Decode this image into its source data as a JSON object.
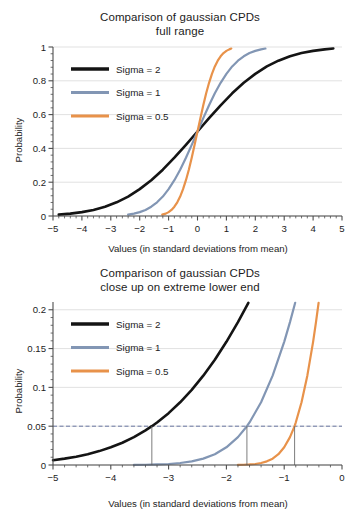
{
  "figure": {
    "width": 360,
    "height": 513,
    "background": "#ffffff"
  },
  "series_colors": {
    "sigma2": "#141414",
    "sigma1": "#8296b4",
    "sigma05": "#e8924a",
    "grid": "#d9d9d9",
    "axis": "#4d4d4d",
    "threshold_line": "#5a6a9a",
    "marker": "#6e6e6e"
  },
  "chart_data": [
    {
      "id": "full-range",
      "type": "line",
      "title": "Comparison of gaussian CPDs",
      "subtitle": "full range",
      "xlabel": "Values (in standard deviations from mean)",
      "ylabel": "Probability",
      "xlim": [
        -5,
        5
      ],
      "ylim": [
        0,
        1
      ],
      "xticks": [
        -5,
        -4,
        -3,
        -2,
        -1,
        0,
        1,
        2,
        3,
        4,
        5
      ],
      "xtick_labels": [
        "−5",
        "−4",
        "−3",
        "−2",
        "−1",
        "0",
        "1",
        "2",
        "3",
        "4",
        "5"
      ],
      "yticks": [
        0,
        0.2,
        0.4,
        0.6,
        0.8,
        1
      ],
      "ytick_labels": [
        "0",
        "0.2",
        "0.4",
        "0.6",
        "0.8",
        "1"
      ],
      "minor_xticks_per_interval": 5,
      "minor_yticks_per_interval": 5,
      "grid": "horizontal",
      "legend_position": "upper-left",
      "series": [
        {
          "name": "Sigma = 2",
          "sigma": 2,
          "color": "#141414",
          "x_range": [
            -4.8,
            4.7
          ],
          "points": [
            [
              -4.8,
              0.008
            ],
            [
              -4.4,
              0.014
            ],
            [
              -4.0,
              0.023
            ],
            [
              -3.6,
              0.036
            ],
            [
              -3.2,
              0.055
            ],
            [
              -2.8,
              0.081
            ],
            [
              -2.4,
              0.115
            ],
            [
              -2.0,
              0.159
            ],
            [
              -1.6,
              0.212
            ],
            [
              -1.2,
              0.274
            ],
            [
              -0.8,
              0.345
            ],
            [
              -0.4,
              0.421
            ],
            [
              0.0,
              0.5
            ],
            [
              0.4,
              0.579
            ],
            [
              0.8,
              0.655
            ],
            [
              1.2,
              0.726
            ],
            [
              1.6,
              0.788
            ],
            [
              2.0,
              0.841
            ],
            [
              2.4,
              0.885
            ],
            [
              2.8,
              0.919
            ],
            [
              3.2,
              0.945
            ],
            [
              3.6,
              0.964
            ],
            [
              4.0,
              0.977
            ],
            [
              4.4,
              0.986
            ],
            [
              4.7,
              0.991
            ]
          ]
        },
        {
          "name": "Sigma = 1",
          "sigma": 1,
          "color": "#8296b4",
          "x_range": [
            -2.4,
            2.35
          ],
          "points": [
            [
              -2.4,
              0.008
            ],
            [
              -2.2,
              0.014
            ],
            [
              -2.0,
              0.023
            ],
            [
              -1.8,
              0.036
            ],
            [
              -1.6,
              0.055
            ],
            [
              -1.4,
              0.081
            ],
            [
              -1.2,
              0.115
            ],
            [
              -1.0,
              0.159
            ],
            [
              -0.8,
              0.212
            ],
            [
              -0.6,
              0.274
            ],
            [
              -0.4,
              0.345
            ],
            [
              -0.2,
              0.421
            ],
            [
              0.0,
              0.5
            ],
            [
              0.2,
              0.579
            ],
            [
              0.4,
              0.655
            ],
            [
              0.6,
              0.726
            ],
            [
              0.8,
              0.788
            ],
            [
              1.0,
              0.841
            ],
            [
              1.2,
              0.885
            ],
            [
              1.4,
              0.919
            ],
            [
              1.6,
              0.945
            ],
            [
              1.8,
              0.964
            ],
            [
              2.0,
              0.977
            ],
            [
              2.2,
              0.986
            ],
            [
              2.35,
              0.991
            ]
          ]
        },
        {
          "name": "Sigma = 0.5",
          "sigma": 0.5,
          "color": "#e8924a",
          "x_range": [
            -1.22,
            1.17
          ],
          "points": [
            [
              -1.22,
              0.008
            ],
            [
              -1.1,
              0.014
            ],
            [
              -1.0,
              0.023
            ],
            [
              -0.9,
              0.036
            ],
            [
              -0.8,
              0.055
            ],
            [
              -0.7,
              0.081
            ],
            [
              -0.6,
              0.115
            ],
            [
              -0.5,
              0.159
            ],
            [
              -0.4,
              0.212
            ],
            [
              -0.3,
              0.274
            ],
            [
              -0.2,
              0.345
            ],
            [
              -0.1,
              0.421
            ],
            [
              0.0,
              0.5
            ],
            [
              0.1,
              0.579
            ],
            [
              0.2,
              0.655
            ],
            [
              0.3,
              0.726
            ],
            [
              0.4,
              0.788
            ],
            [
              0.5,
              0.841
            ],
            [
              0.6,
              0.885
            ],
            [
              0.7,
              0.919
            ],
            [
              0.8,
              0.945
            ],
            [
              0.9,
              0.964
            ],
            [
              1.0,
              0.977
            ],
            [
              1.1,
              0.986
            ],
            [
              1.17,
              0.991
            ]
          ]
        }
      ]
    },
    {
      "id": "lower-tail",
      "type": "line",
      "title": "Comparison of gaussian CPDs",
      "subtitle": "close up on extreme lower end",
      "xlabel": "Values (in standard deviations from mean)",
      "ylabel": "Probability",
      "xlim": [
        -5,
        0
      ],
      "ylim": [
        0,
        0.21
      ],
      "xticks": [
        -5,
        -4,
        -3,
        -2,
        -1,
        0
      ],
      "xtick_labels": [
        "−5",
        "−4",
        "−3",
        "−2",
        "−1",
        "0"
      ],
      "yticks": [
        0,
        0.05,
        0.1,
        0.15,
        0.2
      ],
      "ytick_labels": [
        "0",
        "0.05",
        "0.1",
        "0.15",
        "0.2"
      ],
      "minor_xticks_per_interval": 5,
      "minor_yticks_per_interval": 5,
      "grid": "horizontal",
      "legend_position": "upper-left",
      "threshold": {
        "value": 0.05,
        "style": "dashed",
        "color": "#5a6a9a",
        "label": ""
      },
      "markers": [
        {
          "x": -3.29,
          "label": "",
          "from": 0,
          "to": 0.05
        },
        {
          "x": -1.645,
          "label": "",
          "from": 0,
          "to": 0.05
        },
        {
          "x": -0.82,
          "label": "",
          "from": 0,
          "to": 0.05
        }
      ],
      "series": [
        {
          "name": "Sigma = 2",
          "sigma": 2,
          "color": "#141414",
          "x_range": [
            -5.0,
            -1.62
          ],
          "points": [
            [
              -5.0,
              0.0062
            ],
            [
              -4.8,
              0.0082
            ],
            [
              -4.6,
              0.0107
            ],
            [
              -4.4,
              0.0139
            ],
            [
              -4.2,
              0.0179
            ],
            [
              -4.0,
              0.0228
            ],
            [
              -3.8,
              0.0287
            ],
            [
              -3.6,
              0.0359
            ],
            [
              -3.4,
              0.0446
            ],
            [
              -3.29,
              0.05
            ],
            [
              -3.2,
              0.0548
            ],
            [
              -3.0,
              0.0668
            ],
            [
              -2.8,
              0.0808
            ],
            [
              -2.6,
              0.0968
            ],
            [
              -2.4,
              0.1151
            ],
            [
              -2.2,
              0.1357
            ],
            [
              -2.0,
              0.1587
            ],
            [
              -1.8,
              0.1841
            ],
            [
              -1.62,
              0.209
            ]
          ]
        },
        {
          "name": "Sigma = 1",
          "sigma": 1,
          "color": "#8296b4",
          "x_range": [
            -3.6,
            -0.81
          ],
          "points": [
            [
              -3.6,
              0.0002
            ],
            [
              -3.4,
              0.0003
            ],
            [
              -3.2,
              0.0007
            ],
            [
              -3.0,
              0.0013
            ],
            [
              -2.8,
              0.0026
            ],
            [
              -2.6,
              0.0047
            ],
            [
              -2.4,
              0.0082
            ],
            [
              -2.2,
              0.0139
            ],
            [
              -2.0,
              0.0228
            ],
            [
              -1.8,
              0.0359
            ],
            [
              -1.645,
              0.05
            ],
            [
              -1.6,
              0.0548
            ],
            [
              -1.4,
              0.0808
            ],
            [
              -1.2,
              0.1151
            ],
            [
              -1.0,
              0.1587
            ],
            [
              -0.9,
              0.1841
            ],
            [
              -0.81,
              0.209
            ]
          ]
        },
        {
          "name": "Sigma = 0.5",
          "sigma": 0.5,
          "color": "#e8924a",
          "x_range": [
            -1.8,
            -0.405
          ],
          "points": [
            [
              -1.8,
              0.0002
            ],
            [
              -1.7,
              0.0003
            ],
            [
              -1.6,
              0.0007
            ],
            [
              -1.5,
              0.0013
            ],
            [
              -1.4,
              0.0026
            ],
            [
              -1.3,
              0.0047
            ],
            [
              -1.2,
              0.0082
            ],
            [
              -1.1,
              0.0139
            ],
            [
              -1.0,
              0.0228
            ],
            [
              -0.9,
              0.0359
            ],
            [
              -0.82,
              0.05
            ],
            [
              -0.8,
              0.0548
            ],
            [
              -0.7,
              0.0808
            ],
            [
              -0.6,
              0.1151
            ],
            [
              -0.5,
              0.1587
            ],
            [
              -0.45,
              0.1841
            ],
            [
              -0.405,
              0.209
            ]
          ]
        }
      ]
    }
  ]
}
